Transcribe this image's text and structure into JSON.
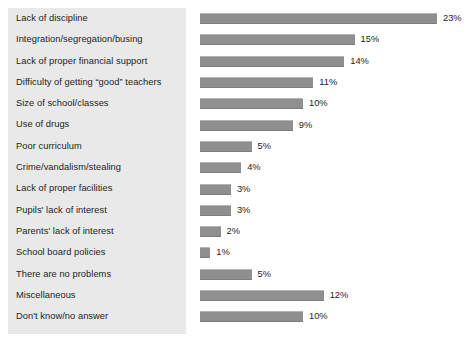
{
  "chart_data": {
    "type": "bar",
    "orientation": "horizontal",
    "title": "",
    "subtitle": "",
    "xlabel": "",
    "ylabel": "",
    "grid": false,
    "legend": null,
    "value_suffix": "%",
    "xlim": [
      0,
      23
    ],
    "categories": [
      "Lack of discipline",
      "Integration/segregation/busing",
      "Lack of proper financial support",
      "Difficulty of getting “good” teachers",
      "Size of school/classes",
      "Use of drugs",
      "Poor curriculum",
      "Crime/vandalism/stealing",
      "Lack of proper facilities",
      "Pupils' lack of interest",
      "Parents' lack of interest",
      "School board policies",
      "There are no problems",
      "Miscellaneous",
      "Don't know/no answer"
    ],
    "values": [
      23,
      15,
      14,
      11,
      10,
      9,
      5,
      4,
      3,
      3,
      2,
      1,
      5,
      12,
      10
    ],
    "value_labels": [
      "23%",
      "15%",
      "14%",
      "11%",
      "10%",
      "9%",
      "5%",
      "4%",
      "3%",
      "3%",
      "2%",
      "1%",
      "5%",
      "12%",
      "10%"
    ],
    "colors": {
      "bar": "#8f8f8f",
      "bar_highlight": "#b4b4b4",
      "bar_shadow": "#7d7d7d",
      "label_panel": "#e9e9e9",
      "text": "#1d1d1d",
      "background": "#ffffff"
    }
  }
}
